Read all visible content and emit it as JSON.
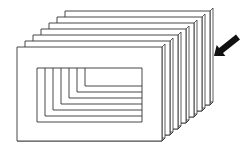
{
  "diagram": {
    "colors": {
      "background": "#ffffff",
      "stroke": "#333333",
      "fill": "#ffffff",
      "arrow": "#111111"
    },
    "frames": {
      "count": 7,
      "front_outer": {
        "x": 17,
        "y": 47,
        "w": 145,
        "h": 94
      },
      "front_window": {
        "x": 37,
        "y": 68,
        "w": 105,
        "h": 54
      },
      "offset_x": 8,
      "offset_y": -6,
      "thickness": 3
    },
    "arrow": {
      "tail": [
        238,
        37
      ],
      "tip": [
        214,
        56
      ],
      "direction": "down-left"
    }
  }
}
